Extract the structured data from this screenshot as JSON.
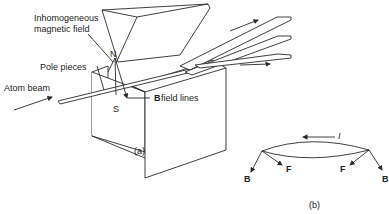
{
  "figure_a": {
    "caption": "(a)",
    "labels": {
      "field": "Inhomogeneous",
      "field2": "magnetic field",
      "pole_pieces": "Pole pieces",
      "atom_beam": "Atom beam",
      "b_prefix": "B",
      "b_suffix": " field lines",
      "north": "N",
      "south": "S"
    }
  },
  "figure_b": {
    "caption": "(b)",
    "labels": {
      "current": "I",
      "force_left": "F",
      "force_right": "F",
      "b_left": "B",
      "b_right": "B"
    }
  },
  "colors": {
    "ink": "#2a2a2a",
    "background": "#ffffff"
  }
}
